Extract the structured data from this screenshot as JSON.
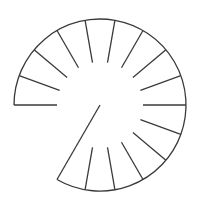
{
  "diagram": {
    "title": "",
    "type": "spiral-staircase-plan",
    "colors": {
      "background": "#ffffff",
      "stroke": "#3a3a3a"
    },
    "geometry": {
      "center": [
        100,
        105
      ],
      "outer_radius": 86,
      "inner_radius": 43,
      "start_angle_deg": 180,
      "end_angle_deg": -120,
      "step_angle_deg": 20,
      "tread_count": 15
    },
    "treads_angles_deg": [
      180,
      160,
      140,
      120,
      100,
      80,
      60,
      40,
      20,
      0,
      -20,
      -40,
      -60,
      -80,
      -100
    ],
    "end_line": {
      "from_angle_deg": -120,
      "to": "center"
    }
  }
}
